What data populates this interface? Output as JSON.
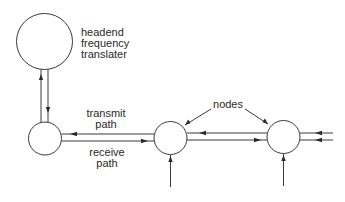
{
  "diagram": {
    "type": "network-topology",
    "colors": {
      "line": "#3a3a3a",
      "text": "#2a2a2a",
      "background": "#ffffff"
    },
    "labels": {
      "headend_line1": "headend",
      "headend_line2": "frequency",
      "headend_line3": "translater",
      "transmit_line1": "transmit",
      "transmit_line2": "path",
      "receive_line1": "receive",
      "receive_line2": "path",
      "nodes": "nodes"
    },
    "elements": [
      {
        "id": "headend",
        "shape": "circle",
        "label": "headend frequency translater"
      },
      {
        "id": "node-1",
        "shape": "circle"
      },
      {
        "id": "node-2",
        "shape": "circle"
      },
      {
        "id": "node-3",
        "shape": "circle"
      }
    ],
    "connections": [
      {
        "from": "node-1",
        "to": "headend",
        "direction": "up"
      },
      {
        "from": "headend",
        "to": "node-1",
        "direction": "down"
      },
      {
        "from": "node-2",
        "to": "node-1",
        "path": "transmit path"
      },
      {
        "from": "node-1",
        "to": "node-2",
        "path": "receive path"
      },
      {
        "from": "node-3",
        "to": "node-2",
        "path": "transmit path"
      },
      {
        "from": "node-2",
        "to": "node-3",
        "path": "receive path"
      },
      {
        "from": "external",
        "to": "node-3",
        "direction": "left"
      },
      {
        "from": "external",
        "to": "node-3",
        "direction": "left"
      },
      {
        "from": "external",
        "to": "node-2",
        "direction": "up"
      },
      {
        "from": "external",
        "to": "node-3",
        "direction": "up"
      }
    ]
  }
}
